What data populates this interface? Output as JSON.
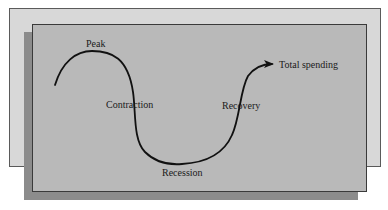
{
  "diagram": {
    "labels": {
      "peak": "Peak",
      "contraction": "Contraction",
      "recession": "Recession",
      "recovery": "Recovery",
      "total_spending": "Total spending"
    },
    "colors": {
      "back_panel": "#d8d8d8",
      "front_panel": "#b9b9b9",
      "shadow": "#8c8c8c",
      "curve": "#111111",
      "text": "#1a1a1a"
    },
    "curve_points": [
      {
        "x": 55,
        "y": 85,
        "note": "start"
      },
      {
        "x": 90,
        "y": 51,
        "note": "peak"
      },
      {
        "x": 135,
        "y": 105,
        "note": "contraction"
      },
      {
        "x": 182,
        "y": 164,
        "note": "recession trough"
      },
      {
        "x": 240,
        "y": 105,
        "note": "recovery"
      },
      {
        "x": 272,
        "y": 64,
        "note": "arrow tip"
      }
    ]
  }
}
